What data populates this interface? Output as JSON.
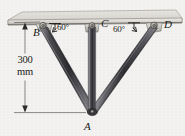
{
  "figure": {
    "background_color": "#f4f3f1",
    "labels": {
      "point_b": "B",
      "point_c": "C",
      "point_d": "D",
      "point_a": "A",
      "angle_left": "60°",
      "angle_right": "60°",
      "dimension_value": "300",
      "dimension_unit": "mm"
    },
    "colors": {
      "member_dark": "#3b3b3f",
      "member_light": "#b9b9bd",
      "member_edge": "#6e6e74",
      "ceiling_fill": "#dedbd6",
      "ceiling_edge": "#8f8d88",
      "ink": "#1a1a1a"
    },
    "geometry": {
      "ceiling_y": 22,
      "joint_b": {
        "x": 43,
        "y": 24
      },
      "joint_c": {
        "x": 92,
        "y": 24
      },
      "joint_d": {
        "x": 155,
        "y": 24
      },
      "vertex_a": {
        "x": 92,
        "y": 113
      },
      "dimension_x": 25,
      "dimension_top_y": 22,
      "dimension_bottom_y": 113
    }
  }
}
